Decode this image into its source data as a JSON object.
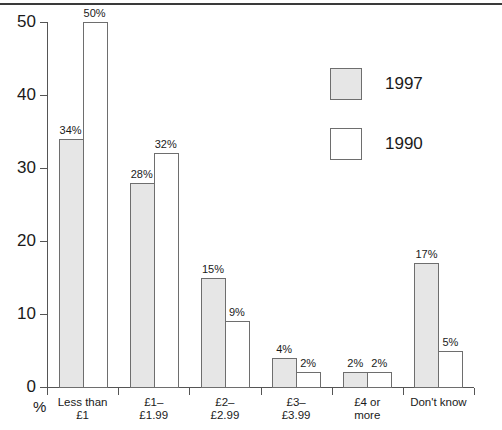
{
  "chart_data": {
    "type": "bar",
    "title": "",
    "subtitle": "",
    "xlabel": "",
    "ylabel": "%",
    "ylim": [
      0,
      50
    ],
    "yticks": [
      0,
      10,
      20,
      30,
      40,
      50
    ],
    "ytick_labels": [
      "0",
      "10",
      "20",
      "30",
      "40",
      "50"
    ],
    "grid": false,
    "legend_position": "upper-right-inside",
    "categories": [
      "Less than\n£1",
      "£1–\n£1.99",
      "£2–\n£2.99",
      "£3–\n£3.99",
      "£4 or\nmore",
      "Don't know"
    ],
    "series": [
      {
        "name": "1997",
        "color": "#e6e6e6",
        "values": [
          34,
          28,
          15,
          4,
          2,
          17
        ],
        "value_labels": [
          "34%",
          "28%",
          "15%",
          "4%",
          "2%",
          "17%"
        ]
      },
      {
        "name": "1990",
        "color": "#ffffff",
        "values": [
          50,
          32,
          9,
          2,
          2,
          5
        ],
        "value_labels": [
          "50%",
          "32%",
          "9%",
          "2%",
          "2%",
          "5%"
        ]
      }
    ]
  },
  "axis": {
    "y_unit_label": "%"
  },
  "legend": {
    "items": [
      {
        "label": "1997",
        "swatch": "filled-gray-swatch"
      },
      {
        "label": "1990",
        "swatch": "outlined-white-swatch"
      }
    ]
  }
}
